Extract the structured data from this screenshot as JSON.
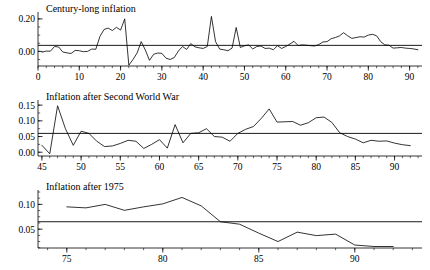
{
  "figure": {
    "background": "#ffffff",
    "line_color": "#000000",
    "width": 430,
    "height": 270
  },
  "chart_data": [
    {
      "type": "line",
      "title": "Century-long inflation",
      "xlabel": "",
      "ylabel": "",
      "xlim": [
        0,
        93
      ],
      "ylim": [
        -0.09,
        0.23
      ],
      "grid": false,
      "legend": null,
      "xticks": [
        0,
        10,
        20,
        30,
        40,
        50,
        60,
        70,
        80,
        90
      ],
      "xtick_labels": [
        "0",
        "10",
        "20",
        "30",
        "40",
        "50",
        "60",
        "70",
        "80",
        "90"
      ],
      "yticks": [
        0.0,
        0.2
      ],
      "ytick_labels": [
        "0.00",
        "0.20"
      ],
      "minor_tick_step_x": 2,
      "minor_tick_step_y": 0.05,
      "mean_level": 0.037,
      "series": [
        {
          "name": "inflation",
          "x": [
            1,
            2,
            3,
            4,
            5,
            6,
            7,
            8,
            9,
            10,
            11,
            12,
            13,
            14,
            15,
            16,
            17,
            18,
            19,
            20,
            21,
            22,
            23,
            24,
            25,
            26,
            27,
            28,
            29,
            30,
            31,
            32,
            33,
            34,
            35,
            36,
            37,
            38,
            39,
            40,
            41,
            42,
            43,
            44,
            45,
            46,
            47,
            48,
            49,
            50,
            51,
            52,
            53,
            54,
            55,
            56,
            57,
            58,
            59,
            60,
            61,
            62,
            63,
            64,
            65,
            66,
            67,
            68,
            69,
            70,
            71,
            72,
            73,
            74,
            75,
            76,
            77,
            78,
            79,
            80,
            81,
            82,
            83,
            84,
            85,
            86,
            87,
            88,
            89,
            90,
            91,
            92
          ],
          "values": [
            -0.005,
            0.002,
            0.001,
            0.03,
            0.027,
            -0.004,
            -0.009,
            -0.013,
            0.006,
            0.004,
            -0.002,
            0.0,
            0.014,
            0.013,
            0.092,
            0.135,
            0.143,
            0.128,
            0.148,
            0.131,
            0.2,
            -0.085,
            -0.05,
            -0.01,
            0.06,
            0.008,
            -0.055,
            -0.018,
            -0.01,
            -0.012,
            -0.042,
            -0.05,
            -0.038,
            0.002,
            0.03,
            0.012,
            0.048,
            0.028,
            0.022,
            0.018,
            0.03,
            0.215,
            0.06,
            0.014,
            0.01,
            0.004,
            0.02,
            0.147,
            0.024,
            0.034,
            0.04,
            0.015,
            0.03,
            0.033,
            0.018,
            0.02,
            0.01,
            0.035,
            0.018,
            0.03,
            0.045,
            0.062,
            0.036,
            0.04,
            0.038,
            0.035,
            0.033,
            0.042,
            0.058,
            0.06,
            0.078,
            0.085,
            0.095,
            0.115,
            0.096,
            0.08,
            0.085,
            0.09,
            0.088,
            0.1,
            0.105,
            0.096,
            0.06,
            0.04,
            0.038,
            0.02,
            0.022,
            0.024,
            0.02,
            0.018,
            0.015,
            0.01,
            0.012
          ]
        }
      ]
    },
    {
      "type": "line",
      "title": "Inflation after Second World War",
      "xlabel": "",
      "ylabel": "",
      "xlim": [
        44.5,
        93.5
      ],
      "ylim": [
        -0.012,
        0.16
      ],
      "grid": false,
      "legend": null,
      "xticks": [
        45,
        50,
        55,
        60,
        65,
        70,
        75,
        80,
        85,
        90
      ],
      "xtick_labels": [
        "45",
        "50",
        "55",
        "60",
        "65",
        "70",
        "75",
        "80",
        "85",
        "90"
      ],
      "yticks": [
        0.0,
        0.05,
        0.1,
        0.15
      ],
      "ytick_labels": [
        "0.00",
        "0.05",
        "0.10",
        "0.15"
      ],
      "minor_tick_step_x": 1,
      "minor_tick_step_y": 0.025,
      "mean_level": 0.06,
      "series": [
        {
          "name": "inflation",
          "x": [
            45,
            46,
            47,
            48,
            49,
            50,
            51,
            52,
            53,
            54,
            55,
            56,
            57,
            58,
            59,
            60,
            61,
            62,
            63,
            64,
            65,
            66,
            67,
            68,
            69,
            70,
            71,
            72,
            73,
            74,
            75,
            76,
            77,
            78,
            79,
            80,
            81,
            82,
            83,
            84,
            85,
            86,
            87,
            88,
            89,
            90,
            91,
            92
          ],
          "values": [
            0.022,
            -0.005,
            0.148,
            0.075,
            0.022,
            0.067,
            0.06,
            0.035,
            0.018,
            0.02,
            0.028,
            0.038,
            0.035,
            0.012,
            0.025,
            0.04,
            0.013,
            0.088,
            0.03,
            0.06,
            0.062,
            0.075,
            0.05,
            0.048,
            0.035,
            0.06,
            0.073,
            0.082,
            0.108,
            0.138,
            0.096,
            0.097,
            0.098,
            0.086,
            0.094,
            0.11,
            0.112,
            0.095,
            0.062,
            0.05,
            0.042,
            0.03,
            0.038,
            0.035,
            0.036,
            0.029,
            0.024,
            0.021
          ]
        }
      ]
    },
    {
      "type": "line",
      "title": "Inflation after 1975",
      "xlabel": "",
      "ylabel": "",
      "xlim": [
        73.5,
        93.5
      ],
      "ylim": [
        0.012,
        0.125
      ],
      "grid": false,
      "legend": null,
      "xticks": [
        75,
        80,
        85,
        90
      ],
      "xtick_labels": [
        "75",
        "80",
        "85",
        "90"
      ],
      "yticks": [
        0.05,
        0.1
      ],
      "ytick_labels": [
        "0.05",
        "0.10"
      ],
      "minor_tick_step_x": 1,
      "minor_tick_step_y": 0.0125,
      "mean_level": 0.065,
      "series": [
        {
          "name": "inflation",
          "x": [
            75,
            76,
            77,
            78,
            79,
            80,
            81,
            82,
            83,
            84,
            85,
            86,
            87,
            88,
            89,
            90,
            91,
            92
          ],
          "values": [
            0.095,
            0.093,
            0.1,
            0.088,
            0.095,
            0.101,
            0.114,
            0.097,
            0.065,
            0.06,
            0.042,
            0.025,
            0.044,
            0.037,
            0.04,
            0.018,
            0.015,
            0.015
          ]
        }
      ]
    }
  ]
}
